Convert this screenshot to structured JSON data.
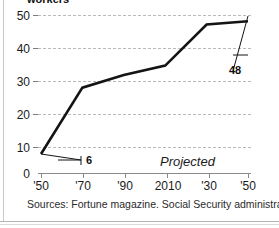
{
  "chart_data": {
    "type": "line",
    "title": "workers",
    "xlabel": "",
    "ylabel": "",
    "x": [
      "'50",
      "'70",
      "'90",
      "2010",
      "'30",
      "'50"
    ],
    "x_values": [
      1950,
      1970,
      1990,
      2010,
      2030,
      2050
    ],
    "categories": [
      "'50",
      "'70",
      "'90",
      "2010",
      "'30",
      "'50"
    ],
    "values": [
      6,
      27,
      31,
      34,
      47,
      48
    ],
    "series": [
      {
        "name": "workers",
        "values": [
          6,
          27,
          31,
          34,
          47,
          48
        ]
      }
    ],
    "ylim": [
      0,
      50
    ],
    "yticks": [
      0,
      10,
      20,
      30,
      40,
      50
    ],
    "ytick_labels": [
      "0",
      "10",
      "20",
      "30",
      "40",
      "50"
    ],
    "xtick_labels": [
      "'50",
      "'70",
      "'90",
      "2010",
      "'30",
      "'50"
    ],
    "grid": true,
    "legend": "none",
    "line_color": "#141414",
    "grid_color": "#b9b9b9",
    "axis_color": "#8a8a8a",
    "annotations": [
      {
        "text": "6",
        "value": 6,
        "at_x": "'50"
      },
      {
        "text": "48",
        "value": 48,
        "at_x": "'50"
      },
      {
        "text": "Projected",
        "style": "italic"
      }
    ]
  },
  "axes": {
    "y_labels": [
      "50",
      "40",
      "30",
      "20",
      "10",
      "0"
    ],
    "x_labels": [
      "'50",
      "'70",
      "'90",
      "2010",
      "'30",
      "'50"
    ]
  },
  "labels": {
    "value_start": "6",
    "value_end": "48",
    "projected": "Projected"
  },
  "footer": {
    "source": "Sources: Fortune magazine. Social Security administration"
  }
}
